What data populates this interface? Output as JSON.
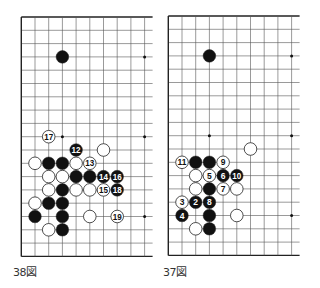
{
  "grid": {
    "spacing_x": 13.7,
    "spacing_y": 13.3,
    "rows": 19,
    "visible_cols": 10,
    "line_color": "#555555",
    "edge_color": "#222222",
    "stone_black": "#111111",
    "stone_white": "#ffffff",
    "stone_outline": "#222222",
    "star_points": [
      [
        3,
        3
      ],
      [
        9,
        3
      ],
      [
        3,
        9
      ],
      [
        9,
        9
      ],
      [
        3,
        15
      ],
      [
        9,
        15
      ]
    ]
  },
  "diagrams": [
    {
      "id": "diagram-38",
      "caption": "38図",
      "origin": [
        21.3,
        17
      ],
      "stones": [
        {
          "c": 3,
          "r": 3,
          "color": "black"
        },
        {
          "c": 2,
          "r": 9,
          "color": "white",
          "label": "17"
        },
        {
          "c": 4,
          "r": 10,
          "color": "black",
          "label": "12"
        },
        {
          "c": 6,
          "r": 10,
          "color": "white"
        },
        {
          "c": 1,
          "r": 11,
          "color": "white"
        },
        {
          "c": 2,
          "r": 11,
          "color": "black"
        },
        {
          "c": 3,
          "r": 11,
          "color": "black"
        },
        {
          "c": 4,
          "r": 11,
          "color": "white"
        },
        {
          "c": 5,
          "r": 11,
          "color": "white",
          "label": "13"
        },
        {
          "c": 2,
          "r": 12,
          "color": "white"
        },
        {
          "c": 3,
          "r": 12,
          "color": "white"
        },
        {
          "c": 4,
          "r": 12,
          "color": "black"
        },
        {
          "c": 5,
          "r": 12,
          "color": "black"
        },
        {
          "c": 6,
          "r": 12,
          "color": "black",
          "label": "14"
        },
        {
          "c": 7,
          "r": 12,
          "color": "black",
          "label": "16"
        },
        {
          "c": 2,
          "r": 13,
          "color": "white"
        },
        {
          "c": 3,
          "r": 13,
          "color": "black"
        },
        {
          "c": 4,
          "r": 13,
          "color": "white"
        },
        {
          "c": 5,
          "r": 13,
          "color": "white"
        },
        {
          "c": 6,
          "r": 13,
          "color": "white",
          "label": "15"
        },
        {
          "c": 7,
          "r": 13,
          "color": "black",
          "label": "18"
        },
        {
          "c": 1,
          "r": 14,
          "color": "white"
        },
        {
          "c": 2,
          "r": 14,
          "color": "black"
        },
        {
          "c": 3,
          "r": 14,
          "color": "black"
        },
        {
          "c": 1,
          "r": 15,
          "color": "black"
        },
        {
          "c": 3,
          "r": 15,
          "color": "black"
        },
        {
          "c": 5,
          "r": 15,
          "color": "white"
        },
        {
          "c": 7,
          "r": 15,
          "color": "white",
          "label": "19"
        },
        {
          "c": 2,
          "r": 16,
          "color": "white"
        },
        {
          "c": 3,
          "r": 16,
          "color": "black"
        }
      ]
    },
    {
      "id": "diagram-37",
      "caption": "37図",
      "origin": [
        168.3,
        16
      ],
      "stones": [
        {
          "c": 3,
          "r": 3,
          "color": "black"
        },
        {
          "c": 6,
          "r": 10,
          "color": "white"
        },
        {
          "c": 1,
          "r": 11,
          "color": "white",
          "label": "11"
        },
        {
          "c": 2,
          "r": 11,
          "color": "black"
        },
        {
          "c": 3,
          "r": 11,
          "color": "black"
        },
        {
          "c": 4,
          "r": 11,
          "color": "white",
          "label": "9"
        },
        {
          "c": 2,
          "r": 12,
          "color": "white"
        },
        {
          "c": 3,
          "r": 12,
          "color": "white",
          "label": "5"
        },
        {
          "c": 4,
          "r": 12,
          "color": "black",
          "label": "6"
        },
        {
          "c": 5,
          "r": 12,
          "color": "black",
          "label": "10"
        },
        {
          "c": 2,
          "r": 13,
          "color": "white"
        },
        {
          "c": 3,
          "r": 13,
          "color": "black"
        },
        {
          "c": 4,
          "r": 13,
          "color": "white",
          "label": "7"
        },
        {
          "c": 5,
          "r": 13,
          "color": "white"
        },
        {
          "c": 1,
          "r": 14,
          "color": "white",
          "label": "3"
        },
        {
          "c": 2,
          "r": 14,
          "color": "black",
          "label": "2"
        },
        {
          "c": 3,
          "r": 14,
          "color": "black",
          "label": "8"
        },
        {
          "c": 1,
          "r": 15,
          "color": "black",
          "label": "4"
        },
        {
          "c": 3,
          "r": 15,
          "color": "black"
        },
        {
          "c": 5,
          "r": 15,
          "color": "white"
        },
        {
          "c": 2,
          "r": 16,
          "color": "white"
        },
        {
          "c": 3,
          "r": 16,
          "color": "black"
        }
      ]
    }
  ]
}
